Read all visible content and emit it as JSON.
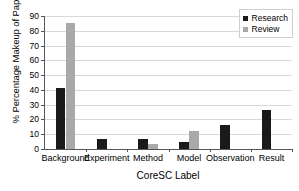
{
  "chart_data": {
    "type": "bar",
    "title": "",
    "xlabel": "CoreSC Label",
    "ylabel": "% Percentage Makeup of Paper",
    "categories": [
      "Background",
      "Experiment",
      "Method",
      "Model",
      "Observation",
      "Result"
    ],
    "series": [
      {
        "name": "Research",
        "color": "#1a1a1a",
        "values": [
          41,
          7,
          6.5,
          4.5,
          16.5,
          26.5
        ]
      },
      {
        "name": "Review",
        "color": "#a9a9a9",
        "values": [
          85,
          0,
          3.5,
          12,
          0,
          0
        ]
      }
    ],
    "ylim": [
      0,
      90
    ],
    "ytick_step": 10,
    "ytick_labels": [
      "0",
      "10",
      "20",
      "30",
      "40",
      "50",
      "60",
      "70",
      "80",
      "90"
    ],
    "grid": true,
    "legend_position": "top-right"
  },
  "legend": {
    "entries": [
      {
        "label": "Research",
        "color": "#1a1a1a"
      },
      {
        "label": "Review",
        "color": "#a9a9a9"
      }
    ]
  }
}
